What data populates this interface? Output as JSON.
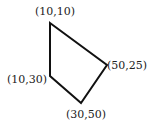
{
  "diagram": {
    "type": "polygon",
    "stroke_color": "#111111",
    "vertices": [
      {
        "label": "(10,10)",
        "x": 10,
        "y": 10
      },
      {
        "label": "(50,25)",
        "x": 50,
        "y": 25
      },
      {
        "label": "(30,50)",
        "x": 30,
        "y": 50
      },
      {
        "label": "(10,30)",
        "x": 10,
        "y": 30
      }
    ]
  }
}
